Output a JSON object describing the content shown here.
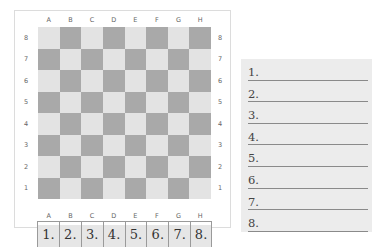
{
  "board": {
    "files": [
      "A",
      "B",
      "C",
      "D",
      "E",
      "F",
      "G",
      "H"
    ],
    "ranks": [
      "8",
      "7",
      "6",
      "5",
      "4",
      "3",
      "2",
      "1"
    ],
    "top_left_square_color": "light",
    "colors": {
      "light": "#e3e3e3",
      "dark": "#a9a9a9",
      "frame_border": "#dcdcdc"
    }
  },
  "tabs": [
    {
      "label": "1."
    },
    {
      "label": "2."
    },
    {
      "label": "3."
    },
    {
      "label": "4."
    },
    {
      "label": "5."
    },
    {
      "label": "6."
    },
    {
      "label": "7."
    },
    {
      "label": "8."
    }
  ],
  "notes": {
    "rows": [
      {
        "label": "1."
      },
      {
        "label": "2."
      },
      {
        "label": "3."
      },
      {
        "label": "4."
      },
      {
        "label": "5."
      },
      {
        "label": "6."
      },
      {
        "label": "7."
      },
      {
        "label": "8."
      }
    ],
    "background": "#ececec"
  }
}
